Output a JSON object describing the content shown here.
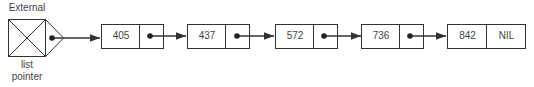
{
  "external_pointer": {
    "label_top": "External",
    "label_bottom_1": "list",
    "label_bottom_2": "pointer"
  },
  "nodes": [
    {
      "value": "405",
      "next": "pointer"
    },
    {
      "value": "437",
      "next": "pointer"
    },
    {
      "value": "572",
      "next": "pointer"
    },
    {
      "value": "736",
      "next": "pointer"
    },
    {
      "value": "842",
      "next": "NIL"
    }
  ],
  "colors": {
    "line": "#333333",
    "text": "#444444"
  }
}
